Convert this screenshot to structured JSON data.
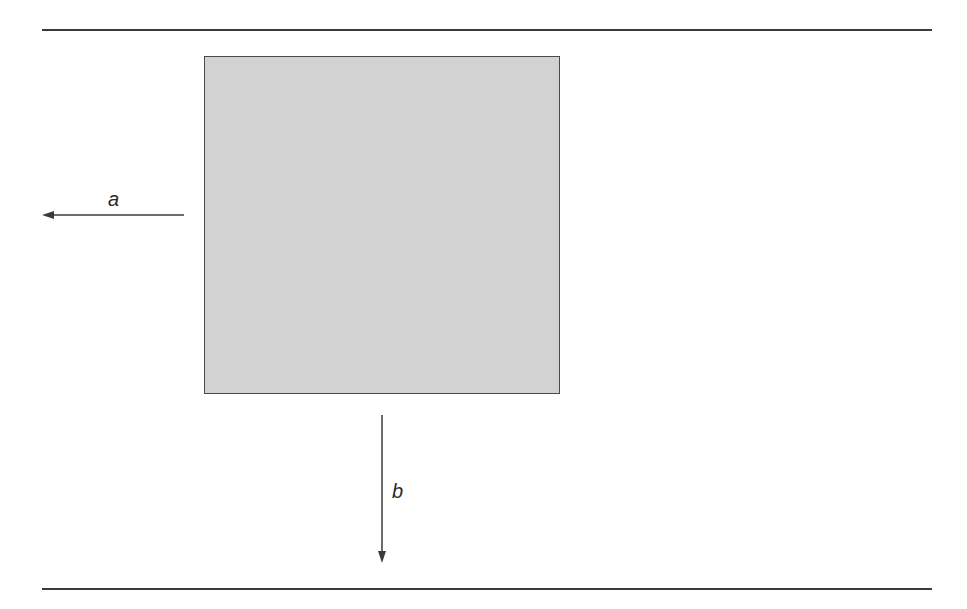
{
  "diagram": {
    "labels": {
      "a": "a",
      "b": "b"
    },
    "colors": {
      "line": "#3a3a3a",
      "box_fill": "#d2d2d2",
      "box_border": "#4a4a4a"
    },
    "arrows": [
      {
        "id": "a",
        "direction": "left"
      },
      {
        "id": "b",
        "direction": "down"
      }
    ]
  }
}
